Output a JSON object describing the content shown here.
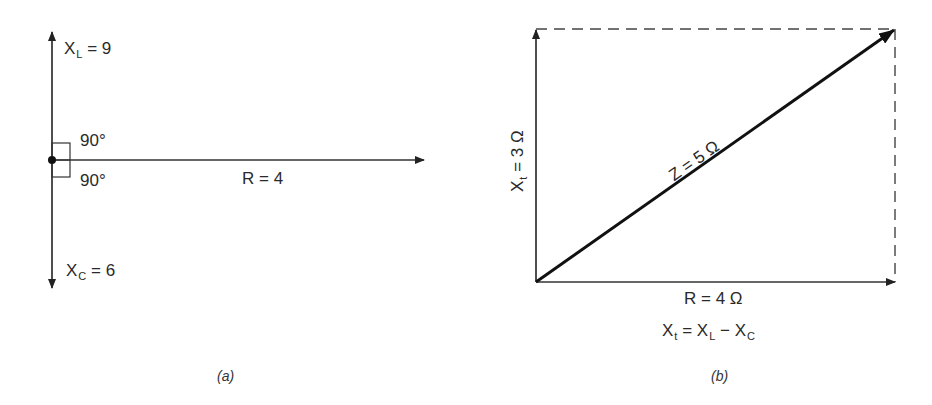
{
  "panel_a": {
    "caption": "(a)",
    "xl": {
      "symbol": "X",
      "sub": "L",
      "rest": "= 9"
    },
    "xc": {
      "symbol": "X",
      "sub": "C",
      "rest": "= 6"
    },
    "r": "R = 4",
    "angle_upper": "90°",
    "angle_lower": "90°"
  },
  "panel_b": {
    "caption": "(b)",
    "xt": {
      "symbol": "X",
      "sub": "t",
      "rest": "= 3 Ω"
    },
    "z": "Z = 5 Ω",
    "r": "R = 4 Ω",
    "formula": {
      "lhs": "X",
      "lhs_sub": "t",
      "eq": "=",
      "a": "X",
      "a_sub": "L",
      "minus": "−",
      "b": "X",
      "b_sub": "C"
    }
  }
}
